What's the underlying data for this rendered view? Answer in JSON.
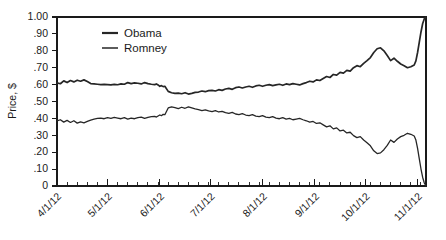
{
  "chart_data": {
    "type": "line",
    "title": "",
    "subtitle": "",
    "xlabel": "",
    "ylabel": "Price, $",
    "ylim": [
      0,
      1.0
    ],
    "xlim": [
      "4/1/12",
      "11/6/12"
    ],
    "grid": false,
    "legend_position": "top-left-inside",
    "y_ticks": [
      "1.00",
      ".90",
      ".80",
      ".70",
      ".60",
      ".50",
      ".40",
      ".30",
      ".20",
      ".10",
      "0"
    ],
    "y_tick_values": [
      1.0,
      0.9,
      0.8,
      0.7,
      0.6,
      0.5,
      0.4,
      0.3,
      0.2,
      0.1,
      0.0
    ],
    "x_ticks": [
      "4/1/12",
      "5/1/12",
      "6/1/12",
      "7/1/12",
      "8/1/12",
      "9/1/12",
      "10/1/12",
      "11/1/12"
    ],
    "x_tick_positions": [
      0,
      30,
      61,
      91,
      122,
      153,
      183,
      214
    ],
    "x_minor_interval_days": 6,
    "x_axis_total_days": 219,
    "line_color": "#262626",
    "series": [
      {
        "name": "Obama",
        "stroke_width": 1.7,
        "x": [
          0,
          2,
          4,
          6,
          8,
          10,
          12,
          14,
          16,
          18,
          20,
          22,
          24,
          26,
          28,
          30,
          32,
          34,
          36,
          38,
          40,
          42,
          44,
          46,
          48,
          50,
          52,
          54,
          56,
          58,
          59,
          60,
          61,
          62,
          63,
          64,
          66,
          68,
          70,
          72,
          74,
          76,
          78,
          80,
          82,
          84,
          86,
          88,
          90,
          92,
          94,
          96,
          98,
          100,
          102,
          104,
          106,
          108,
          110,
          112,
          114,
          116,
          118,
          120,
          122,
          124,
          126,
          128,
          130,
          132,
          134,
          136,
          138,
          140,
          142,
          144,
          146,
          148,
          150,
          152,
          154,
          156,
          158,
          160,
          162,
          164,
          166,
          168,
          170,
          172,
          174,
          176,
          178,
          180,
          182,
          184,
          186,
          188,
          190,
          192,
          194,
          196,
          198,
          200,
          202,
          204,
          206,
          208,
          210,
          212,
          213,
          214,
          215,
          216,
          217,
          218,
          219
        ],
        "values": [
          0.61,
          0.605,
          0.622,
          0.612,
          0.624,
          0.616,
          0.626,
          0.62,
          0.628,
          0.618,
          0.606,
          0.604,
          0.602,
          0.6,
          0.601,
          0.6,
          0.598,
          0.601,
          0.599,
          0.604,
          0.602,
          0.612,
          0.606,
          0.61,
          0.608,
          0.604,
          0.612,
          0.606,
          0.602,
          0.6,
          0.604,
          0.598,
          0.59,
          0.594,
          0.588,
          0.59,
          0.56,
          0.552,
          0.548,
          0.55,
          0.546,
          0.552,
          0.544,
          0.548,
          0.554,
          0.556,
          0.562,
          0.558,
          0.564,
          0.566,
          0.562,
          0.57,
          0.566,
          0.574,
          0.578,
          0.572,
          0.582,
          0.586,
          0.58,
          0.586,
          0.59,
          0.584,
          0.592,
          0.596,
          0.59,
          0.596,
          0.6,
          0.594,
          0.598,
          0.602,
          0.596,
          0.604,
          0.6,
          0.606,
          0.602,
          0.598,
          0.606,
          0.612,
          0.62,
          0.616,
          0.628,
          0.624,
          0.636,
          0.648,
          0.642,
          0.66,
          0.656,
          0.672,
          0.668,
          0.684,
          0.68,
          0.7,
          0.712,
          0.706,
          0.726,
          0.742,
          0.76,
          0.79,
          0.812,
          0.818,
          0.8,
          0.772,
          0.742,
          0.756,
          0.738,
          0.722,
          0.712,
          0.7,
          0.706,
          0.716,
          0.74,
          0.79,
          0.85,
          0.91,
          0.96,
          0.99,
          1.0
        ]
      },
      {
        "name": "Romney",
        "stroke_width": 1.3,
        "x": [
          0,
          2,
          4,
          6,
          8,
          10,
          12,
          14,
          16,
          18,
          20,
          22,
          24,
          26,
          28,
          30,
          32,
          34,
          36,
          38,
          40,
          42,
          44,
          46,
          48,
          50,
          52,
          54,
          56,
          58,
          59,
          60,
          61,
          62,
          63,
          64,
          66,
          68,
          70,
          72,
          74,
          76,
          78,
          80,
          82,
          84,
          86,
          88,
          90,
          92,
          94,
          96,
          98,
          100,
          102,
          104,
          106,
          108,
          110,
          112,
          114,
          116,
          118,
          120,
          122,
          124,
          126,
          128,
          130,
          132,
          134,
          136,
          138,
          140,
          142,
          144,
          146,
          148,
          150,
          152,
          154,
          156,
          158,
          160,
          162,
          164,
          166,
          168,
          170,
          172,
          174,
          176,
          178,
          180,
          182,
          184,
          186,
          188,
          190,
          192,
          194,
          196,
          198,
          200,
          202,
          204,
          206,
          208,
          210,
          212,
          213,
          214,
          215,
          216,
          217,
          218,
          219
        ],
        "values": [
          0.385,
          0.392,
          0.378,
          0.388,
          0.376,
          0.386,
          0.372,
          0.38,
          0.374,
          0.382,
          0.39,
          0.396,
          0.4,
          0.402,
          0.398,
          0.404,
          0.4,
          0.406,
          0.402,
          0.398,
          0.404,
          0.396,
          0.402,
          0.398,
          0.404,
          0.408,
          0.4,
          0.406,
          0.41,
          0.412,
          0.408,
          0.414,
          0.42,
          0.416,
          0.424,
          0.422,
          0.462,
          0.468,
          0.464,
          0.458,
          0.466,
          0.46,
          0.468,
          0.462,
          0.456,
          0.452,
          0.446,
          0.45,
          0.444,
          0.44,
          0.446,
          0.438,
          0.442,
          0.434,
          0.43,
          0.436,
          0.426,
          0.422,
          0.428,
          0.42,
          0.416,
          0.422,
          0.414,
          0.41,
          0.416,
          0.408,
          0.404,
          0.41,
          0.402,
          0.398,
          0.404,
          0.396,
          0.4,
          0.392,
          0.396,
          0.4,
          0.392,
          0.386,
          0.378,
          0.382,
          0.37,
          0.374,
          0.362,
          0.35,
          0.356,
          0.338,
          0.344,
          0.326,
          0.33,
          0.314,
          0.318,
          0.298,
          0.286,
          0.292,
          0.272,
          0.256,
          0.238,
          0.208,
          0.192,
          0.196,
          0.215,
          0.24,
          0.272,
          0.258,
          0.278,
          0.292,
          0.3,
          0.312,
          0.306,
          0.296,
          0.272,
          0.222,
          0.162,
          0.102,
          0.052,
          0.018,
          0.0
        ]
      }
    ]
  },
  "legend": {
    "items": [
      {
        "label": "Obama"
      },
      {
        "label": "Romney"
      }
    ]
  }
}
